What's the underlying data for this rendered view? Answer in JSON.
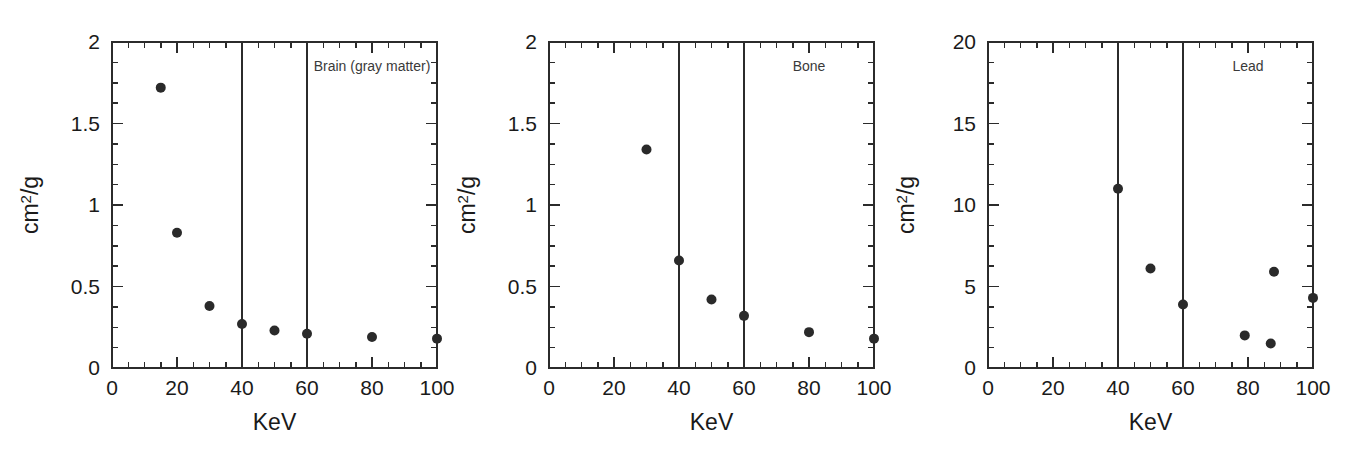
{
  "figure": {
    "width": 1358,
    "height": 458,
    "background": "#ffffff",
    "ink_color": "#2a2a2a"
  },
  "chart_data": [
    {
      "type": "scatter",
      "title": "Brain (gray matter)",
      "xlabel": "KeV",
      "ylabel": "cm2/g",
      "ylabel_display": "cm",
      "ylabel_superscript": "2",
      "ylabel_suffix": "/g",
      "xlim": [
        0,
        100
      ],
      "ylim": [
        0,
        2
      ],
      "x_ticks": [
        0,
        20,
        40,
        60,
        80,
        100
      ],
      "x_tick_labels": [
        "0",
        "20",
        "40",
        "60",
        "80",
        "100"
      ],
      "x_minor_interval": 5,
      "y_ticks": [
        0,
        0.5,
        1,
        1.5,
        2
      ],
      "y_tick_labels": [
        "0",
        "0.5",
        "1",
        "1.5",
        "2"
      ],
      "y_minor_interval": 0.125,
      "grid": false,
      "legend": "none",
      "vertical_reference_lines": [
        40,
        60
      ],
      "x": [
        15,
        20,
        30,
        40,
        50,
        60,
        80,
        100
      ],
      "values": [
        1.72,
        0.83,
        0.38,
        0.27,
        0.23,
        0.21,
        0.19,
        0.18
      ]
    },
    {
      "type": "scatter",
      "title": "Bone",
      "xlabel": "KeV",
      "ylabel": "cm2/g",
      "ylabel_display": "cm",
      "ylabel_superscript": "2",
      "ylabel_suffix": "/g",
      "xlim": [
        0,
        100
      ],
      "ylim": [
        0,
        2
      ],
      "x_ticks": [
        0,
        20,
        40,
        60,
        80,
        100
      ],
      "x_tick_labels": [
        "0",
        "20",
        "40",
        "60",
        "80",
        "100"
      ],
      "x_minor_interval": 5,
      "y_ticks": [
        0,
        0.5,
        1,
        1.5,
        2
      ],
      "y_tick_labels": [
        "0",
        "0.5",
        "1",
        "1.5",
        "2"
      ],
      "y_minor_interval": 0.125,
      "grid": false,
      "legend": "none",
      "vertical_reference_lines": [
        40,
        60
      ],
      "x": [
        30,
        40,
        50,
        60,
        80,
        100
      ],
      "values": [
        1.34,
        0.66,
        0.42,
        0.32,
        0.22,
        0.18
      ]
    },
    {
      "type": "scatter",
      "title": "Lead",
      "xlabel": "KeV",
      "ylabel": "cm2/g",
      "ylabel_display": "cm",
      "ylabel_superscript": "2",
      "ylabel_suffix": "/g",
      "xlim": [
        0,
        100
      ],
      "ylim": [
        0,
        20
      ],
      "x_ticks": [
        0,
        20,
        40,
        60,
        80,
        100
      ],
      "x_tick_labels": [
        "0",
        "20",
        "40",
        "60",
        "80",
        "100"
      ],
      "x_minor_interval": 5,
      "y_ticks": [
        0,
        5,
        10,
        15,
        20
      ],
      "y_tick_labels": [
        "0",
        "5",
        "10",
        "15",
        "20"
      ],
      "y_minor_interval": 1.25,
      "grid": false,
      "legend": "none",
      "vertical_reference_lines": [
        40,
        60
      ],
      "x": [
        40,
        50,
        60,
        79,
        87,
        88,
        100
      ],
      "values": [
        11.0,
        6.1,
        3.9,
        2.0,
        1.5,
        5.9,
        4.3
      ]
    }
  ]
}
